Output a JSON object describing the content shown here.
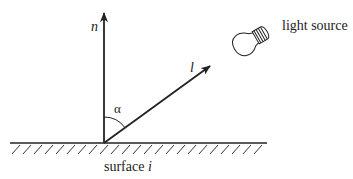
{
  "diagram": {
    "labels": {
      "normal": "n",
      "light_vector": "l",
      "angle": "α",
      "light_source": "light source",
      "surface_prefix": "surface ",
      "surface_index": "i"
    },
    "angle_between_n_and_l_deg": 54,
    "colors": {
      "stroke": "#222222",
      "background": "#ffffff"
    },
    "icons": [
      "light-bulb-icon"
    ]
  }
}
